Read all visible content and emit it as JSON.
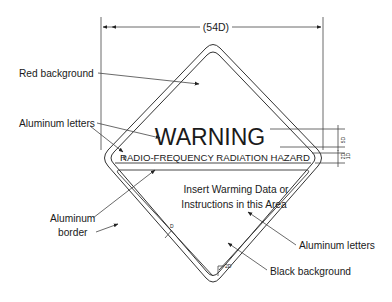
{
  "diagram": {
    "dimension_label": "(54D)",
    "sign": {
      "title": "WARNING",
      "subtitle": "RADIO-FREQUENCY RADIATION HAZARD",
      "body_line1": "Insert Warming Data or",
      "body_line2": "Instructions in this Area"
    },
    "callouts": {
      "red_background": "Red background",
      "aluminum_letters_top": "Aluminum letters",
      "aluminum_border_line1": "Aluminum",
      "aluminum_border_line2": "border",
      "aluminum_letters_bottom": "Aluminum letters",
      "black_background": "Black background"
    },
    "small_dims": {
      "title_height": "5D",
      "subtitle_height": "2D",
      "gap": "1D",
      "border_width": "D",
      "corner_radius": "2D",
      "left_corner": "D"
    },
    "colors": {
      "line": "#333333",
      "text": "#1a1a1a",
      "background": "#ffffff"
    }
  }
}
